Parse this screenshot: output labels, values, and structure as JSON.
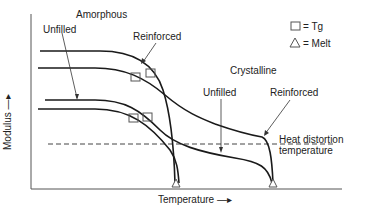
{
  "diagram": {
    "labels": {
      "amorphous": "Amorphous",
      "amorphous_unfilled": "Unfilled",
      "amorphous_reinforced": "Reinforced",
      "crystalline": "Crystalline",
      "crystalline_unfilled": "Unfilled",
      "crystalline_reinforced": "Reinforced",
      "heat_distortion_line1": "Heat distortion",
      "heat_distortion_line2": "temperature"
    },
    "axes": {
      "x_label": "Temperature —▸",
      "y_label": "Modulus —▸"
    },
    "legend": [
      {
        "symbol": "square",
        "text": "= Tg"
      },
      {
        "symbol": "triangle",
        "text": "= Melt"
      }
    ],
    "colors": {
      "line": "#1a1a1a",
      "marker": "#555555",
      "dashed": "#444444",
      "text": "#222222"
    }
  }
}
